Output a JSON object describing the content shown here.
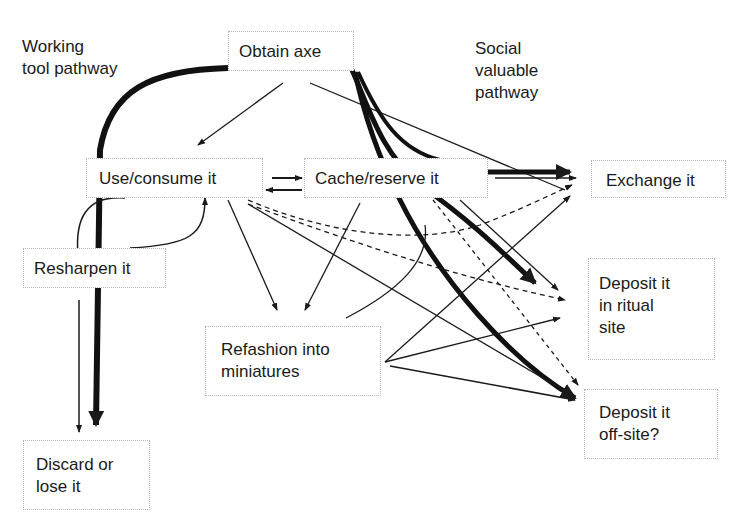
{
  "diagram": {
    "pathway_labels": {
      "working": "Working\ntool pathway",
      "social": "Social\nvaluable\npathway"
    },
    "nodes": {
      "obtain": "Obtain axe",
      "use": "Use/consume it",
      "cache": "Cache/reserve it",
      "exchange": "Exchange it",
      "resharpen": "Resharpen it",
      "refashion": "Refashion into\nminiatures",
      "ritual": "Deposit it\nin ritual\nsite",
      "offsite": "Deposit it\noff-site?",
      "discard": "Discard or\nlose it"
    },
    "edges": [
      {
        "from": "obtain",
        "to": "use",
        "style": "thin"
      },
      {
        "from": "obtain",
        "to": "exchange",
        "style": "thin"
      },
      {
        "from": "obtain",
        "to": "discard",
        "style": "thick",
        "pathway": "working"
      },
      {
        "from": "obtain",
        "to": "ritual",
        "style": "thick",
        "pathway": "social"
      },
      {
        "from": "obtain",
        "to": "offsite",
        "style": "thick",
        "pathway": "social"
      },
      {
        "from": "use",
        "to": "cache",
        "style": "thin"
      },
      {
        "from": "cache",
        "to": "use",
        "style": "thin"
      },
      {
        "from": "use",
        "to": "resharpen",
        "style": "thin"
      },
      {
        "from": "resharpen",
        "to": "use",
        "style": "thin"
      },
      {
        "from": "resharpen",
        "to": "discard",
        "style": "thin"
      },
      {
        "from": "use",
        "to": "refashion",
        "style": "thin"
      },
      {
        "from": "use",
        "to": "exchange",
        "style": "dashed"
      },
      {
        "from": "use",
        "to": "ritual",
        "style": "dashed"
      },
      {
        "from": "use",
        "to": "offsite",
        "style": "thin"
      },
      {
        "from": "cache",
        "to": "exchange",
        "style": "thick",
        "pathway": "social"
      },
      {
        "from": "cache",
        "to": "refashion",
        "style": "thin"
      },
      {
        "from": "cache",
        "to": "offsite",
        "style": "dashed"
      },
      {
        "from": "refashion",
        "to": "exchange",
        "style": "thin"
      },
      {
        "from": "refashion",
        "to": "ritual",
        "style": "thin"
      },
      {
        "from": "refashion",
        "to": "offsite",
        "style": "thin"
      }
    ]
  }
}
